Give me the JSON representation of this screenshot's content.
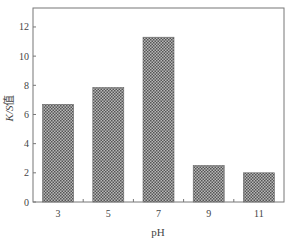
{
  "chart_data": {
    "type": "bar",
    "title": "",
    "xlabel": "pH",
    "ylabel": "K/S值",
    "ylabel_italic_part": "K/S",
    "ylabel_suffix": "值",
    "categories": [
      "3",
      "5",
      "7",
      "9",
      "11"
    ],
    "values": [
      6.7,
      7.85,
      11.3,
      2.5,
      2.0
    ],
    "ylim": [
      0,
      13.3
    ],
    "yticks": [
      0,
      2,
      4,
      6,
      8,
      10,
      12
    ],
    "grid": false,
    "legend": null,
    "bar_fill": "crosshatch-gray",
    "colors": {
      "bar": "#6e6e6e",
      "bar_light": "#b8b8b8",
      "axis": "#777777"
    }
  }
}
